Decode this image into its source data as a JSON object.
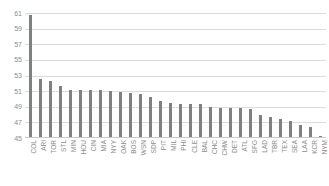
{
  "chart_data": {
    "type": "bar",
    "title": "",
    "subtitle": "",
    "xlabel": "",
    "ylabel": "",
    "ylim": [
      45,
      61
    ],
    "ytick_step": 2,
    "yticks": [
      61,
      59,
      57,
      55,
      53,
      51,
      49,
      47,
      45
    ],
    "ytick_labels": [
      "61",
      "59",
      "57",
      "55",
      "53",
      "51",
      "49",
      "47",
      "45"
    ],
    "grid": true,
    "grid_axis": "y",
    "legend": false,
    "legend_position": "none",
    "bar_color": "#808080",
    "grid_color": "#dcdcdc",
    "axis_label_color": "#8c8c8c",
    "categories": [
      "COL",
      "ARI",
      "TOR",
      "STL",
      "MIN",
      "HOU",
      "CIN",
      "MIA",
      "NYY",
      "OAK",
      "BOS",
      "WSN",
      "SDP",
      "PIT",
      "MIL",
      "PHI",
      "CLE",
      "BAL",
      "CHC",
      "CHW",
      "DET",
      "ATL",
      "SFG",
      "LAD",
      "TBR",
      "TEX",
      "SEA",
      "LAA",
      "KCR",
      "NYM"
    ],
    "values": [
      60.7,
      52.6,
      52.3,
      51.7,
      51.2,
      51.1,
      51.1,
      51.1,
      51.0,
      50.9,
      50.8,
      50.6,
      50.3,
      49.7,
      49.5,
      49.4,
      49.4,
      49.3,
      49.0,
      48.9,
      48.8,
      48.8,
      48.7,
      48.0,
      47.7,
      47.4,
      47.2,
      46.7,
      46.4,
      45.3
    ]
  }
}
